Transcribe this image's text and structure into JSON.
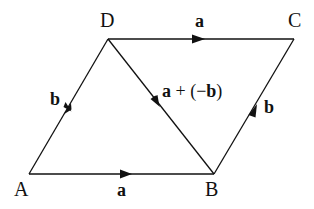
{
  "diagram": {
    "points": {
      "A": {
        "label": "A",
        "x": 29,
        "y": 174
      },
      "B": {
        "label": "B",
        "x": 214,
        "y": 174
      },
      "C": {
        "label": "C",
        "x": 294,
        "y": 39
      },
      "D": {
        "label": "D",
        "x": 108,
        "y": 39
      }
    },
    "vectors": {
      "AB": {
        "label": "a",
        "from": "A",
        "to": "B"
      },
      "DC": {
        "label": "a",
        "from": "D",
        "to": "C"
      },
      "AD": {
        "label": "b",
        "from": "A",
        "to": "D"
      },
      "BC": {
        "label": "b",
        "from": "B",
        "to": "C"
      },
      "DB": {
        "label_a": "a",
        "label_plus": " + (−",
        "label_b": "b",
        "label_close": ")",
        "from": "D",
        "to": "B"
      }
    },
    "colors": {
      "stroke": "#111111",
      "background": "#ffffff"
    }
  }
}
